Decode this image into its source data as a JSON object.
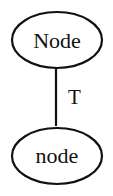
{
  "diagram": {
    "nodes": [
      {
        "id": "top",
        "label": "Node"
      },
      {
        "id": "bottom",
        "label": "node"
      }
    ],
    "edges": [
      {
        "from": "top",
        "to": "bottom",
        "label": "T"
      }
    ]
  }
}
